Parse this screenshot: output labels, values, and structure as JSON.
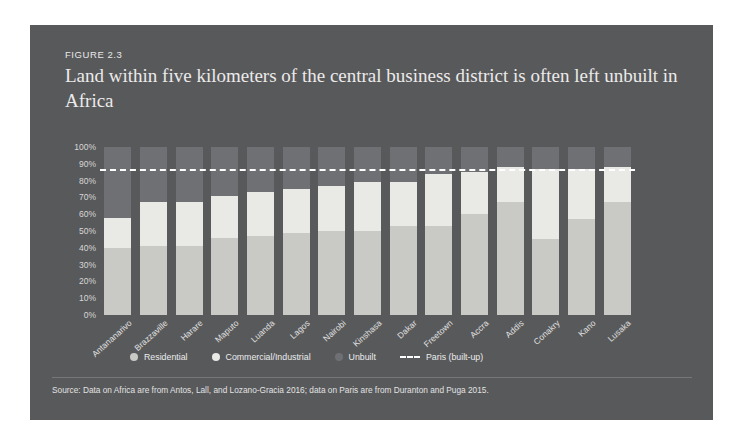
{
  "figure": {
    "number": "FIGURE 2.3",
    "title": "Land within five kilometers of the central business district is often left unbuilt in Africa",
    "source": "Source: Data on Africa are from Antos, Lall, and Lozano-Gracia 2016; data on Paris are from Duranton and Puga 2015.",
    "card_color": "#58595b"
  },
  "legend": {
    "items": [
      {
        "label": "Residential",
        "color": "#c9cac6",
        "marker": "dot"
      },
      {
        "label": "Commercial/Industrial",
        "color": "#e9e9e6",
        "marker": "dot"
      },
      {
        "label": "Unbuilt",
        "color": "#6e7073",
        "marker": "dot"
      },
      {
        "label": "Paris (built-up)",
        "color": "#ffffff",
        "marker": "dashed-line"
      }
    ]
  },
  "chart_data": {
    "type": "bar",
    "stacked": true,
    "title": "Land within five kilometers of the central business district is often left unbuilt in Africa",
    "xlabel": "",
    "ylabel": "",
    "ylim": [
      0,
      100
    ],
    "ytick_labels": [
      "100%",
      "90%",
      "80%",
      "70%",
      "60%",
      "50%",
      "40%",
      "30%",
      "20%",
      "10%",
      "0%"
    ],
    "ytick_values": [
      100,
      90,
      80,
      70,
      60,
      50,
      40,
      30,
      20,
      10,
      0
    ],
    "grid": false,
    "legend_position": "bottom",
    "categories": [
      "Antananarivo",
      "Brazzaville",
      "Harare",
      "Maputo",
      "Luanda",
      "Lagos",
      "Nairobi",
      "Kinshasa",
      "Dakar",
      "Freetown",
      "Accra",
      "Addis",
      "Conakry",
      "Kano",
      "Lusaka"
    ],
    "series": [
      {
        "name": "Residential",
        "color": "#c9cac6",
        "values": [
          40,
          41,
          41,
          46,
          47,
          49,
          50,
          50,
          53,
          53,
          60,
          67,
          45,
          57,
          67
        ]
      },
      {
        "name": "Commercial/Industrial",
        "color": "#e9e9e6",
        "values": [
          18,
          26,
          26,
          25,
          26,
          26,
          27,
          29,
          26,
          31,
          25,
          21,
          42,
          30,
          21
        ]
      },
      {
        "name": "Unbuilt",
        "color": "#6e7073",
        "values": [
          42,
          33,
          33,
          29,
          27,
          25,
          23,
          21,
          21,
          16,
          15,
          12,
          13,
          13,
          12
        ]
      }
    ],
    "reference_line": {
      "name": "Paris (built-up)",
      "value": 87,
      "style": "dashed",
      "color": "#ffffff"
    }
  }
}
